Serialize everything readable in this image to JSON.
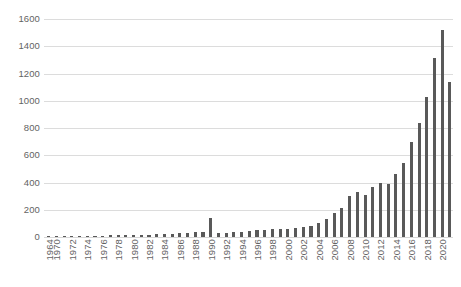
{
  "chart_data": {
    "type": "bar",
    "title": "",
    "subtitle": "",
    "xlabel": "",
    "ylabel": "",
    "ylim": [
      0,
      1600
    ],
    "y_ticks": [
      0,
      200,
      400,
      600,
      800,
      1000,
      1200,
      1400,
      1600
    ],
    "grid": "horizontal",
    "legend": "none",
    "bar_color": "#595959",
    "gridline_color": "#dcdcdc",
    "tick_label_color": "#636363",
    "x_tick_labels": [
      "1964",
      "1970",
      "1972",
      "1974",
      "1976",
      "1978",
      "1980",
      "1982",
      "1984",
      "1986",
      "1988",
      "1990",
      "1992",
      "1994",
      "1996",
      "1998",
      "2000",
      "2002",
      "2004",
      "2006",
      "2008",
      "2010",
      "2012",
      "2014",
      "2016",
      "2018",
      "2020"
    ],
    "x_tick_label_orientation": "vertical",
    "categories": [
      "1964",
      "1970",
      "1971",
      "1972",
      "1973",
      "1974",
      "1975",
      "1976",
      "1977",
      "1978",
      "1979",
      "1980",
      "1981",
      "1982",
      "1983",
      "1984",
      "1985",
      "1986",
      "1987",
      "1988",
      "1989",
      "1990",
      "1991",
      "1992",
      "1993",
      "1994",
      "1995",
      "1996",
      "1997",
      "1998",
      "1999",
      "2000",
      "2001",
      "2002",
      "2003",
      "2004",
      "2005",
      "2006",
      "2007",
      "2008",
      "2009",
      "2010",
      "2011",
      "2012",
      "2013",
      "2014",
      "2015",
      "2016",
      "2017",
      "2018",
      "2019",
      "2020",
      "2021"
    ],
    "values": [
      2,
      3,
      3,
      4,
      5,
      6,
      8,
      10,
      12,
      14,
      16,
      18,
      16,
      18,
      20,
      22,
      25,
      28,
      32,
      36,
      40,
      140,
      30,
      33,
      36,
      40,
      44,
      48,
      52,
      56,
      60,
      62,
      66,
      70,
      80,
      105,
      130,
      175,
      210,
      300,
      330,
      310,
      365,
      400,
      390,
      460,
      545,
      700,
      840,
      1030,
      1315,
      1520,
      1140
    ]
  }
}
